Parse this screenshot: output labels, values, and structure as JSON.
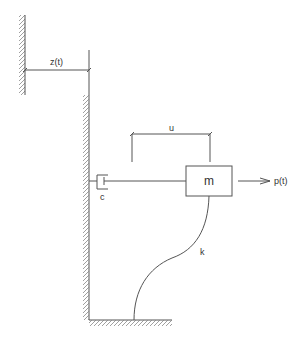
{
  "diagram": {
    "type": "single-degree-of-freedom system with base motion",
    "labels": {
      "base_displacement": "z(t)",
      "relative_displacement": "u",
      "mass": "m",
      "damper": "c",
      "spring": "k",
      "force": "p(t)"
    },
    "colors": {
      "line": "#555555",
      "hatch": "#888888",
      "text": "#333333",
      "background": "#ffffff"
    }
  }
}
